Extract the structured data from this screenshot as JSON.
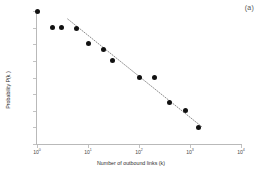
{
  "panel": {
    "label": "(a)"
  },
  "chart_data": {
    "type": "scatter",
    "title": "",
    "xlabel": "Number of outbound links (k)",
    "ylabel": "Probability P(k )",
    "xscale": "log",
    "yscale": "log",
    "xlim": [
      1,
      10000
    ],
    "ylim": [
      1e-08,
      1
    ],
    "grid": false,
    "legend": null,
    "xticks": [
      1,
      10,
      100,
      1000,
      10000
    ],
    "xtick_labels": [
      "10 0",
      "10 1",
      "10 2",
      "10 3",
      "10 4"
    ],
    "xtick_exponents": [
      "0",
      "1",
      "2",
      "3",
      "4"
    ],
    "yticks": [
      1,
      0.1,
      0.01,
      0.001,
      0.0001,
      1e-05,
      1e-06,
      1e-07,
      1e-08
    ],
    "ytick_exponents": [
      "0",
      "-1",
      "-2",
      "-3",
      "-4",
      "-5",
      "-6",
      "-7",
      "-8"
    ],
    "marker": "filled-circle",
    "marker_color": "#111111",
    "points": [
      {
        "x": 1,
        "y": 1
      },
      {
        "x": 2,
        "y": 0.1
      },
      {
        "x": 3,
        "y": 0.095
      },
      {
        "x": 6,
        "y": 0.09
      },
      {
        "x": 10,
        "y": 0.011
      },
      {
        "x": 20,
        "y": 0.005
      },
      {
        "x": 30,
        "y": 0.001
      },
      {
        "x": 100,
        "y": 0.0001
      },
      {
        "x": 200,
        "y": 0.0001
      },
      {
        "x": 400,
        "y": 3e-06
      },
      {
        "x": 800,
        "y": 1e-06
      },
      {
        "x": 1500,
        "y": 1e-07
      }
    ],
    "trendline": {
      "style": "dotted",
      "color": "#6d6d6d",
      "x_start": 4,
      "y_start": 0.33,
      "x_end": 1700,
      "y_end": 1.1e-07
    }
  }
}
